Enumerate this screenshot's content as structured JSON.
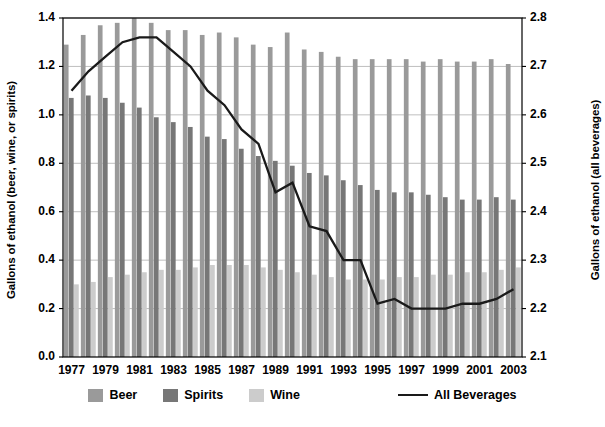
{
  "chart_data": {
    "type": "bar",
    "title": "",
    "subtitle": "",
    "xlabel": "",
    "ylabel": "Gallons of ethanol (beer, wine, or spirits)",
    "ylabel_secondary": "Gallons of ethanol (all beverages)",
    "grid": true,
    "legend_position": "bottom",
    "ylim": [
      0.0,
      1.4
    ],
    "ylim_secondary": [
      2.1,
      2.8
    ],
    "yticks": [
      "0.0",
      "0.2",
      "0.4",
      "0.6",
      "0.8",
      "1.0",
      "1.2",
      "1.4"
    ],
    "ytick_values": [
      0.0,
      0.2,
      0.4,
      0.6,
      0.8,
      1.0,
      1.2,
      1.4
    ],
    "yticks_secondary": [
      "2.1",
      "2.2",
      "2.3",
      "2.4",
      "2.5",
      "2.6",
      "2.7",
      "2.8"
    ],
    "ytick_values_secondary": [
      2.1,
      2.2,
      2.3,
      2.4,
      2.5,
      2.6,
      2.7,
      2.8
    ],
    "categories": [
      1977,
      1978,
      1979,
      1980,
      1981,
      1982,
      1983,
      1984,
      1985,
      1986,
      1987,
      1988,
      1989,
      1990,
      1991,
      1992,
      1993,
      1994,
      1995,
      1996,
      1997,
      1998,
      1999,
      2000,
      2001,
      2002,
      2003
    ],
    "xtick_labels": [
      "1977",
      "1979",
      "1981",
      "1983",
      "1985",
      "1987",
      "1989",
      "1991",
      "1993",
      "1995",
      "1997",
      "1999",
      "2001",
      "2003"
    ],
    "xtick_years": [
      1977,
      1979,
      1981,
      1983,
      1985,
      1987,
      1989,
      1991,
      1993,
      1995,
      1997,
      1999,
      2001,
      2003
    ],
    "series": [
      {
        "name": "Beer",
        "kind": "bar",
        "axis": "left",
        "color": "#9a9a9a",
        "values": [
          1.29,
          1.33,
          1.37,
          1.38,
          1.4,
          1.38,
          1.35,
          1.35,
          1.33,
          1.34,
          1.32,
          1.29,
          1.28,
          1.34,
          1.27,
          1.26,
          1.24,
          1.23,
          1.23,
          1.23,
          1.23,
          1.22,
          1.23,
          1.22,
          1.22,
          1.23,
          1.21
        ]
      },
      {
        "name": "Spirits",
        "kind": "bar",
        "axis": "left",
        "color": "#777777",
        "values": [
          1.07,
          1.08,
          1.07,
          1.05,
          1.03,
          0.99,
          0.97,
          0.95,
          0.91,
          0.9,
          0.86,
          0.83,
          0.81,
          0.79,
          0.76,
          0.75,
          0.73,
          0.71,
          0.69,
          0.68,
          0.68,
          0.67,
          0.66,
          0.65,
          0.65,
          0.66,
          0.65
        ]
      },
      {
        "name": "Wine",
        "kind": "bar",
        "axis": "left",
        "color": "#cccccc",
        "values": [
          0.3,
          0.31,
          0.33,
          0.34,
          0.35,
          0.36,
          0.36,
          0.37,
          0.38,
          0.38,
          0.38,
          0.37,
          0.36,
          0.35,
          0.34,
          0.33,
          0.32,
          0.32,
          0.32,
          0.33,
          0.33,
          0.34,
          0.34,
          0.35,
          0.35,
          0.36,
          0.37
        ]
      },
      {
        "name": "All Beverages",
        "kind": "line",
        "axis": "right",
        "color": "#1a1a1a",
        "values": [
          2.65,
          2.69,
          2.72,
          2.75,
          2.76,
          2.76,
          2.73,
          2.7,
          2.65,
          2.62,
          2.57,
          2.54,
          2.44,
          2.46,
          2.37,
          2.36,
          2.3,
          2.3,
          2.21,
          2.22,
          2.2,
          2.2,
          2.2,
          2.21,
          2.21,
          2.22,
          2.24
        ]
      }
    ],
    "legend": [
      {
        "label": "Beer",
        "marker": "swatch",
        "color": "#9a9a9a"
      },
      {
        "label": "Spirits",
        "marker": "swatch",
        "color": "#777777"
      },
      {
        "label": "Wine",
        "marker": "swatch",
        "color": "#cccccc"
      },
      {
        "label": "All Beverages",
        "marker": "line",
        "color": "#1a1a1a"
      }
    ]
  },
  "plot": {
    "left": 63,
    "right": 522,
    "top": 18,
    "bottom": 357,
    "frame_color": "#000000",
    "grid_color": "#b8b8b8",
    "background": "#ffffff"
  }
}
